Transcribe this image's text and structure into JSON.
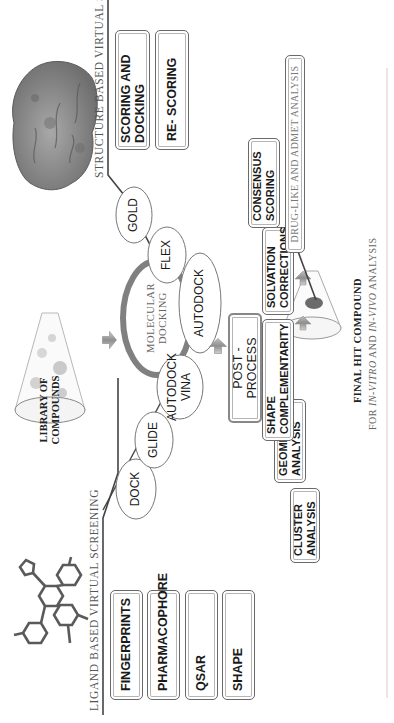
{
  "sections": {
    "ligand": {
      "heading": "LIGAND BASED VIRTUAL SCREENING",
      "methods": [
        "FINGERPRINTS",
        "PHARMACOPHORE",
        "QSAR",
        "SHAPE"
      ]
    },
    "structure": {
      "heading": "STRUCTURE BASED VIRTUAL SCREENING",
      "methods": [
        {
          "line1": "SCORING AND",
          "line2": "DOCKING"
        },
        {
          "line1": "RE- SCORING",
          "line2": ""
        }
      ]
    }
  },
  "library": {
    "line1": "LIBRARY OF",
    "line2": "COMPOUNDS"
  },
  "docking": {
    "center": {
      "line1": "MOLECULAR",
      "line2": "DOCKING"
    },
    "programs": [
      {
        "id": "dock",
        "label": "DOCK"
      },
      {
        "id": "glide",
        "label": "GLIDE"
      },
      {
        "id": "autodock-vina",
        "line1": "AUTODOCK",
        "line2": "VINA"
      },
      {
        "id": "autodock",
        "label": "AUTODOCK"
      },
      {
        "id": "flex",
        "label": "FLEX"
      },
      {
        "id": "gold",
        "label": "GOLD"
      }
    ]
  },
  "post_process": {
    "label": "POST - PROCESS"
  },
  "analyses": [
    {
      "id": "cluster",
      "line1": "CLUSTER",
      "line2": "ANALYSIS"
    },
    {
      "id": "geometric",
      "line1": "GEOMETRIC",
      "line2": "ANALYSIS"
    },
    {
      "id": "shape-complementarity",
      "line1": "SHAPE",
      "line2": "COMPLEMENTARITY"
    },
    {
      "id": "solvation",
      "line1": "SOLVATION",
      "line2": "CORRECTIONS"
    },
    {
      "id": "consensus",
      "line1": "CONSENSUS",
      "line2": "SCORING"
    }
  ],
  "admet": {
    "label": "DRUG-LIKE AND ADMET ANALYSIS"
  },
  "final": {
    "title": "FINAL HIT COMPOUND",
    "subtitle_prefix": "FOR ",
    "subtitle_italic1": "IN-VITRO",
    "subtitle_mid": " AND ",
    "subtitle_italic2": "IN-VIVO",
    "subtitle_suffix": " ANALYSIS"
  },
  "colors": {
    "line": "#444444",
    "docking_ring": "#808080",
    "arrow": "#9a9a9a",
    "hit_dot": "#6b6b6b",
    "protein": "#8a8a8a",
    "ligand_mol": "#5a5a5a"
  }
}
